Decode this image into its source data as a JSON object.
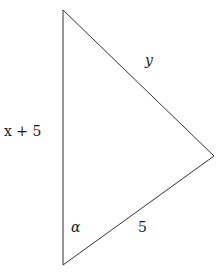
{
  "diagram": {
    "type": "triangle",
    "vertices": {
      "top": [
        63,
        10
      ],
      "right": [
        214,
        156
      ],
      "bottom": [
        63,
        265
      ]
    },
    "stroke_color": "#333333",
    "labels": {
      "left_side": "x + 5",
      "hypotenuse_side": "y",
      "bottom_side": "5",
      "angle": "α"
    }
  }
}
